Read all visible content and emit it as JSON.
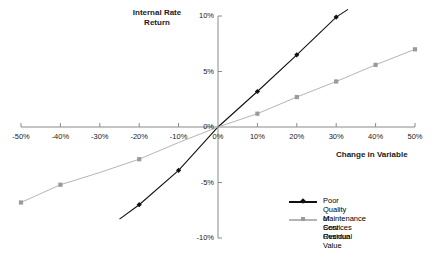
{
  "chart_data": {
    "type": "line",
    "title": "",
    "xlabel": "Change in Variable",
    "ylabel": "Internal Rate Return",
    "ylabel_line1": "Internal Rate",
    "ylabel_line2": "Return",
    "x": [
      -50,
      -40,
      -30,
      -20,
      -10,
      0,
      10,
      20,
      30,
      40,
      50
    ],
    "xticklabels": [
      "-50%",
      "-40%",
      "-30%",
      "-20%",
      "-10%",
      "0%",
      "10%",
      "20%",
      "30%",
      "40%",
      "50%"
    ],
    "yticks": [
      10,
      5,
      0,
      -5,
      -10
    ],
    "yticklabels": [
      "10%",
      "5%",
      "0%",
      "-5%",
      "-10%"
    ],
    "xlim": [
      -50,
      50
    ],
    "ylim": [
      -10,
      10
    ],
    "grid": false,
    "legend_position": "bottom-right",
    "series": [
      {
        "name": "Poor Quality of Services",
        "marker": "diamond",
        "color": "#111111",
        "x": [
          -25,
          -20,
          -10,
          0,
          10,
          20,
          30,
          33
        ],
        "values": [
          -8.3,
          -7.0,
          -3.9,
          0.0,
          3.2,
          6.5,
          9.9,
          10.6
        ],
        "marker_x": [
          -20,
          -10,
          10,
          20,
          30
        ],
        "marker_values": [
          -7.0,
          -3.9,
          3.2,
          6.5,
          9.9
        ]
      },
      {
        "name": "Maintenance Cost Overrun",
        "marker": "square",
        "color": "#b5b5b5",
        "x": [
          -50,
          -40,
          -30,
          -20,
          -10,
          0,
          10,
          20,
          30,
          40,
          50
        ],
        "values": [
          -6.8,
          -5.2,
          -4.1,
          -2.9,
          -1.4,
          0.0,
          1.2,
          2.7,
          4.1,
          5.6,
          7.0
        ],
        "marker_x": [
          -50,
          -40,
          -20,
          10,
          20,
          30,
          40,
          50
        ],
        "marker_values": [
          -6.8,
          -5.2,
          -2.9,
          1.2,
          2.7,
          4.1,
          5.6,
          7.0
        ]
      },
      {
        "name": "Residual Value",
        "marker": "none",
        "color": "#ffffff",
        "x": [],
        "values": [],
        "marker_x": [],
        "marker_values": []
      }
    ],
    "legend_entries": [
      {
        "label": "Poor Quality of Services",
        "marker": "diamond",
        "color": "#111111"
      },
      {
        "label": "Maintenance Cost Overrun",
        "marker": "square",
        "color": "#b5b5b5"
      },
      {
        "label": "Residual Value",
        "marker": "none",
        "color": "#ffffff"
      }
    ]
  },
  "colors": {
    "axis": "#8a8a8a",
    "series_dark": "#111111",
    "series_gray": "#b5b5b5",
    "text": "#1a1a1a",
    "background": "#ffffff"
  }
}
